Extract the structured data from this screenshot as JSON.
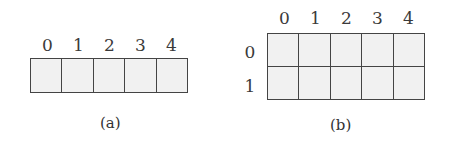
{
  "figure_a": {
    "caption": "(a)",
    "column_labels": [
      "0",
      "1",
      "2",
      "3",
      "4"
    ],
    "rows": 1,
    "cols": 5
  },
  "figure_b": {
    "caption": "(b)",
    "column_labels": [
      "0",
      "1",
      "2",
      "3",
      "4"
    ],
    "row_labels": [
      "0",
      "1"
    ],
    "rows": 2,
    "cols": 5
  }
}
